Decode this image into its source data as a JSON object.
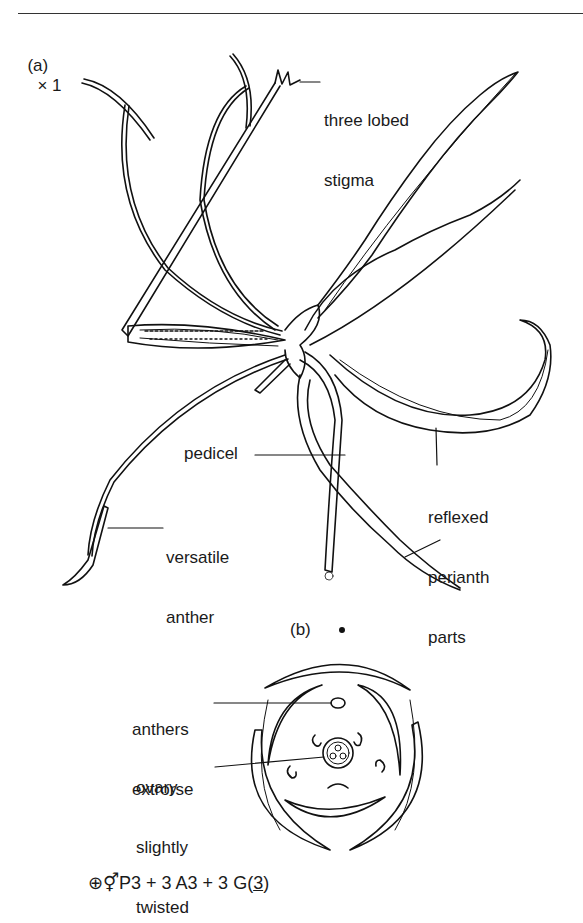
{
  "figure": {
    "part_a": {
      "label": "(a)",
      "scale": "× 1",
      "annotations": {
        "stigma": [
          "three lobed",
          "stigma"
        ],
        "pedicel": "pedicel",
        "anther": [
          "versatile",
          "anther"
        ],
        "perianth": [
          "reflexed",
          "perianth",
          "parts"
        ]
      }
    },
    "part_b": {
      "label": "(b)",
      "annotations": {
        "anthers": [
          "anthers",
          "extrorse"
        ],
        "ovary": [
          "ovary",
          "slightly",
          "twisted"
        ]
      }
    },
    "floral_formula": {
      "symmetry": "⊕",
      "sex": "⚥",
      "perianth": "P3 + 3",
      "androecium": "A3 + 3",
      "gynoecium_prefix": "G(",
      "gynoecium_count": "3",
      "gynoecium_suffix": ")"
    }
  }
}
